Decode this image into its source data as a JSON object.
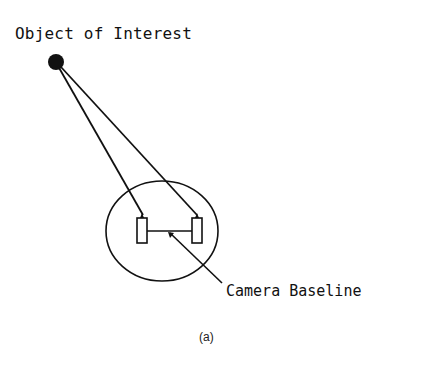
{
  "diagram": {
    "object_label": "Object of Interest",
    "baseline_label": "Camera Baseline",
    "caption": "(a)",
    "colors": {
      "stroke": "#111111",
      "background": "#ffffff"
    }
  }
}
